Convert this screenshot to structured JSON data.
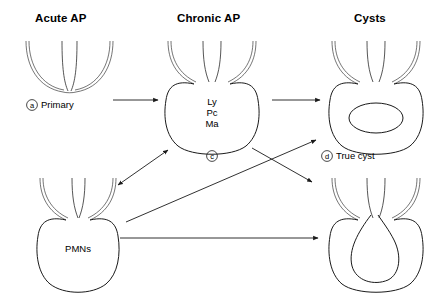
{
  "figure": {
    "background_color": "#ffffff",
    "line_color": "#1a1a1a",
    "width": 429,
    "height": 296
  },
  "columns": [
    {
      "label": "Acute AP"
    },
    {
      "label": "Chronic AP"
    },
    {
      "label": "Cysts"
    }
  ],
  "lesions": {
    "primary": {
      "marker": "a",
      "label": "Primary",
      "inner_text": []
    },
    "chronic": {
      "marker": "c",
      "label": "",
      "inner_text": [
        "Ly",
        "Pc",
        "Ma"
      ]
    },
    "true_cyst": {
      "marker": "d",
      "label": "True cyst",
      "inner_text": []
    },
    "pmn": {
      "marker": "",
      "label": "",
      "inner_text": [
        "PMNs"
      ]
    },
    "pocket_cyst": {
      "marker": "",
      "label": "",
      "inner_text": []
    }
  }
}
